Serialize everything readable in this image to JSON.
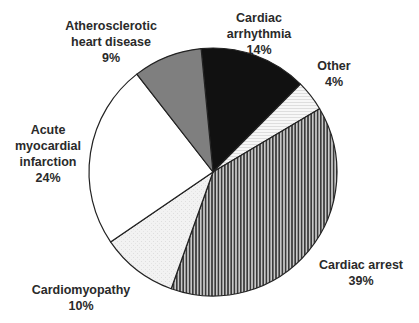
{
  "chart_data": {
    "type": "pie",
    "title": "",
    "start_angle_deg": 354.5,
    "direction": "clockwise",
    "center": [
      213,
      172
    ],
    "radius": 124,
    "slices": [
      {
        "name": "Cardiac arrhythmia",
        "value": 14,
        "label_lines": [
          "Cardiac",
          "arrhythmia",
          "14%"
        ],
        "fill": "solid-black",
        "color": "#111111",
        "label_pos": [
          259,
          10
        ]
      },
      {
        "name": "Other",
        "value": 4,
        "label_lines": [
          "Other",
          "4%"
        ],
        "fill": "horizontal-lines",
        "color": "#f4f4f4",
        "label_pos": [
          334,
          58
        ]
      },
      {
        "name": "Cardiac arrest",
        "value": 39,
        "label_lines": [
          "Cardiac arrest",
          "39%"
        ],
        "fill": "vertical-lines",
        "color": "#555555",
        "label_pos": [
          361,
          257
        ]
      },
      {
        "name": "Cardiomyopathy",
        "value": 10,
        "label_lines": [
          "Cardiomyopathy",
          "10%"
        ],
        "fill": "light-stipple",
        "color": "#f0f0f0",
        "label_pos": [
          81,
          282
        ]
      },
      {
        "name": "Acute myocardial infarction",
        "value": 24,
        "label_lines": [
          "Acute",
          "myocardial",
          "infarction",
          "24%"
        ],
        "fill": "solid-white",
        "color": "#ffffff",
        "label_pos": [
          48,
          122
        ]
      },
      {
        "name": "Atherosclerotic heart disease",
        "value": 9,
        "label_lines": [
          "Atherosclerotic",
          "heart disease",
          "9%"
        ],
        "fill": "solid-gray",
        "color": "#7f7f7f",
        "label_pos": [
          111,
          18
        ]
      }
    ],
    "legend": "none (direct labels)",
    "units": "%"
  }
}
